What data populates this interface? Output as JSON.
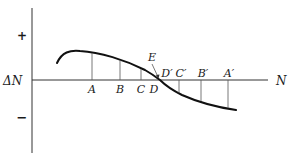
{
  "diagram": {
    "y_axis_label": "ΔN",
    "x_axis_label": "N",
    "plus_sign": "+",
    "minus_sign": "−",
    "point_label": "E",
    "below_axis_labels": [
      "A",
      "B",
      "C",
      "D"
    ],
    "above_axis_labels": [
      "D′",
      "C′",
      "B′",
      "A′"
    ]
  }
}
